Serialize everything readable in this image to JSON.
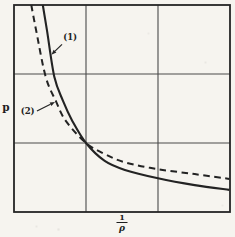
{
  "figure": {
    "y_axis_label": "p",
    "x_axis_label": {
      "numerator": "1",
      "denominator": "ρ"
    }
  },
  "chart_data": {
    "type": "line",
    "title": "",
    "xlabel": "1/ρ",
    "ylabel": "p",
    "x_range": [
      0,
      3
    ],
    "y_range": [
      0,
      3
    ],
    "grid": true,
    "grid_divisions": 3,
    "axis_tick_labels": "none",
    "crossing_point": [
      1.0,
      1.0
    ],
    "series": [
      {
        "name": "(1)",
        "style": "solid",
        "color": "#232323",
        "points": [
          [
            0.4,
            3.0
          ],
          [
            0.46,
            2.62
          ],
          [
            0.56,
            1.96
          ],
          [
            0.68,
            1.61
          ],
          [
            0.81,
            1.32
          ],
          [
            1.0,
            1.0
          ],
          [
            1.26,
            0.74
          ],
          [
            1.54,
            0.61
          ],
          [
            2.0,
            0.49
          ],
          [
            2.51,
            0.39
          ],
          [
            2.99,
            0.32
          ]
        ]
      },
      {
        "name": "(2)",
        "style": "dashed",
        "color": "#232323",
        "points": [
          [
            0.24,
            3.0
          ],
          [
            0.31,
            2.62
          ],
          [
            0.44,
            1.96
          ],
          [
            0.58,
            1.61
          ],
          [
            0.72,
            1.32
          ],
          [
            1.0,
            1.0
          ],
          [
            1.26,
            0.84
          ],
          [
            1.54,
            0.72
          ],
          [
            2.0,
            0.62
          ],
          [
            2.51,
            0.55
          ],
          [
            2.99,
            0.48
          ]
        ]
      }
    ],
    "annotations": [
      {
        "text": "(1)",
        "label_pos": [
          0.78,
          2.54
        ],
        "arrow_from": [
          0.667,
          2.43
        ],
        "arrow_to": [
          0.52,
          2.28
        ]
      },
      {
        "text": "(2)",
        "label_pos": [
          0.19,
          1.46
        ],
        "arrow_from": [
          0.319,
          1.464
        ],
        "arrow_to": [
          0.569,
          1.594
        ]
      }
    ]
  },
  "colors": {
    "ink": "#252525",
    "grid": "#4a4a4a",
    "paper": "#f6f4ef"
  }
}
